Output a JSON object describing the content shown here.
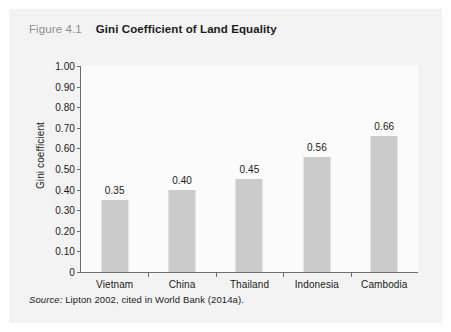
{
  "figure": {
    "number": "Figure 4.1",
    "title": "Gini Coefficient of Land Equality",
    "source_label": "Source:",
    "source_text": " Lipton 2002, cited in World Bank (2014a)."
  },
  "colors": {
    "panel_background": "#f3f3f3",
    "plot_background": "#fbfbfb",
    "bar_fill": "#cbcbcb",
    "axis_line": "#6d6d6d",
    "text": "#1a1a1a",
    "figure_number": "#8e8e8e"
  },
  "chart_data": {
    "type": "bar",
    "title": "Gini Coefficient of Land Equality",
    "categories": [
      "Vietnam",
      "China",
      "Thailand",
      "Indonesia",
      "Cambodia"
    ],
    "values": [
      0.35,
      0.4,
      0.45,
      0.56,
      0.66
    ],
    "value_labels": [
      "0.35",
      "0.40",
      "0.45",
      "0.56",
      "0.66"
    ],
    "xlabel": "",
    "ylabel": "Gini coefficient",
    "ylim": [
      0,
      1.0
    ],
    "ytick_values": [
      1.0,
      0.9,
      0.8,
      0.7,
      0.6,
      0.5,
      0.4,
      0.3,
      0.2,
      0.1,
      0
    ],
    "ytick_labels": [
      "1.00",
      "0.90",
      "0.80",
      "0.70",
      "0.60",
      "0.50",
      "0.40",
      "0.30",
      "0.20",
      "0.10",
      "0"
    ],
    "grid": false,
    "legend": null
  }
}
